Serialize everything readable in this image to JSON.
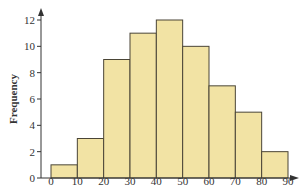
{
  "chart_data": {
    "type": "bar",
    "subtype": "histogram",
    "title": "",
    "xlabel": "",
    "ylabel": "Frequency",
    "bins": [
      [
        0,
        10
      ],
      [
        10,
        20
      ],
      [
        20,
        30
      ],
      [
        30,
        40
      ],
      [
        40,
        50
      ],
      [
        50,
        60
      ],
      [
        60,
        70
      ],
      [
        70,
        80
      ],
      [
        80,
        90
      ]
    ],
    "categories": [
      "0-10",
      "10-20",
      "20-30",
      "30-40",
      "40-50",
      "50-60",
      "60-70",
      "70-80",
      "80-90"
    ],
    "values": [
      1,
      3,
      9,
      11,
      12,
      10,
      7,
      5,
      2
    ],
    "xticks": [
      0,
      10,
      20,
      30,
      40,
      50,
      60,
      70,
      80,
      90
    ],
    "yticks": [
      0,
      2,
      4,
      6,
      8,
      10,
      12
    ],
    "xlim": [
      0,
      90
    ],
    "ylim": [
      0,
      12
    ],
    "grid": false,
    "legend": null,
    "colors": {
      "bar_fill": "#f2e3a4",
      "bar_stroke": "#4a4536",
      "axis": "#333333"
    }
  }
}
